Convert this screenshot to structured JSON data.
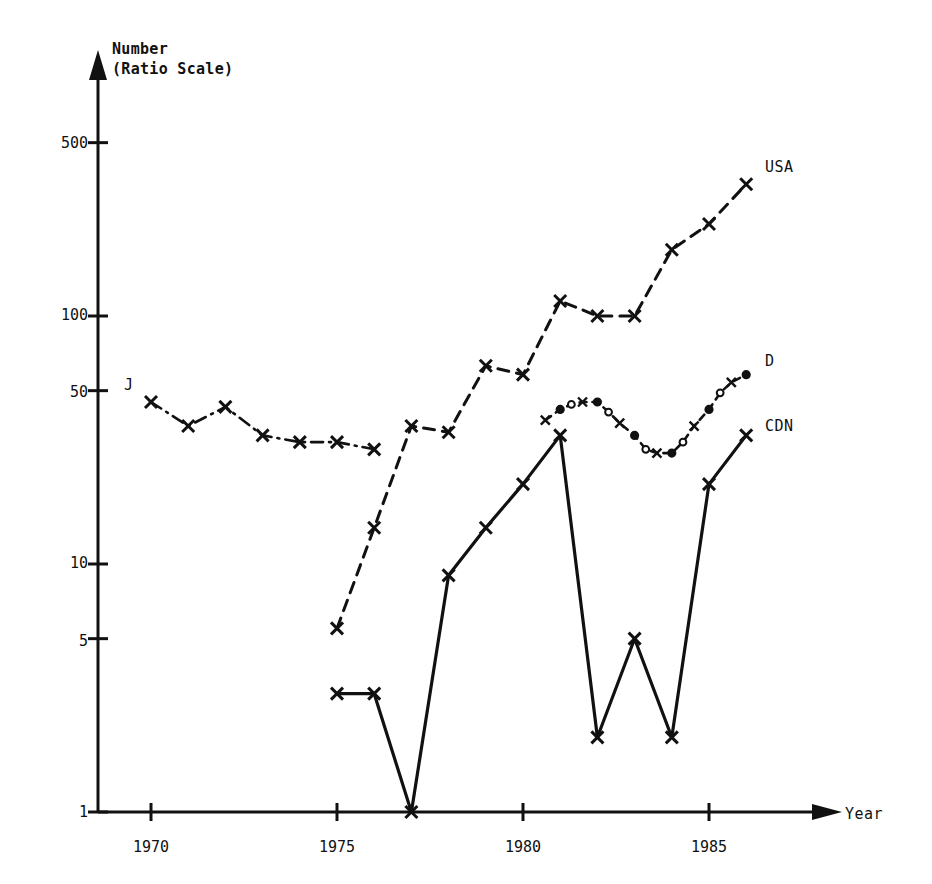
{
  "chart_data": {
    "type": "line",
    "title": "",
    "subtitle": "",
    "ylabel_line1": "Number",
    "ylabel_line2": "(Ratio Scale)",
    "xlabel": "Year",
    "scale": "log",
    "grid": false,
    "legend_position": "inline-right",
    "x_ticks": [
      "1970",
      "1975",
      "1980",
      "1985"
    ],
    "x_tick_values": [
      1970,
      1975,
      1980,
      1985
    ],
    "y_ticks": [
      "1",
      "5",
      "10",
      "50",
      "100",
      "500"
    ],
    "y_tick_values": [
      1,
      5,
      10,
      50,
      100,
      500
    ],
    "xlim": [
      1968.2,
      1987.6
    ],
    "ylim": [
      1,
      900
    ],
    "series": [
      {
        "name": "J",
        "label": "J",
        "line_style": "dash-dot",
        "marker": "x",
        "x": [
          1970,
          1971,
          1972,
          1973,
          1974,
          1975,
          1976
        ],
        "values": [
          45,
          36,
          43,
          33,
          31,
          31,
          29
        ]
      },
      {
        "name": "USA",
        "label": "USA",
        "line_style": "dashed",
        "marker": "x",
        "x": [
          1975,
          1976,
          1977,
          1978,
          1979,
          1980,
          1981,
          1982,
          1983,
          1984,
          1985,
          1986
        ],
        "values": [
          5.5,
          14,
          36,
          34,
          63,
          58,
          115,
          100,
          100,
          185,
          235,
          340
        ]
      },
      {
        "name": "CDN",
        "label": "CDN",
        "line_style": "solid",
        "marker": "x",
        "x": [
          1975,
          1976,
          1977,
          1978,
          1979,
          1980,
          1981,
          1982,
          1983,
          1984,
          1985,
          1986
        ],
        "values": [
          3,
          3,
          1,
          9,
          14,
          21,
          33,
          2,
          5,
          2,
          21,
          33
        ]
      },
      {
        "name": "D",
        "label": "D",
        "line_style": "dotted-dash",
        "marker": "x-circle",
        "x": [
          1980.6,
          1981,
          1981.3,
          1981.6,
          1982,
          1982.3,
          1982.6,
          1983,
          1983.3,
          1983.6,
          1984,
          1984.3,
          1984.6,
          1985,
          1985.3,
          1985.6,
          1986
        ],
        "values": [
          38,
          42,
          44,
          45,
          45,
          41,
          37,
          33,
          29,
          28,
          28,
          31,
          36,
          42,
          49,
          54,
          58
        ]
      }
    ]
  },
  "labels": {
    "j": "J",
    "usa": "USA",
    "cdn": "CDN",
    "d": "D",
    "year": "Year",
    "number": "Number",
    "ratio_scale": "(Ratio Scale)"
  },
  "y_axis_labels": {
    "t500": "500",
    "t100": "100",
    "t50": "50",
    "t10": "10",
    "t5": "5",
    "t1": "1"
  },
  "x_axis_labels": {
    "t1970": "1970",
    "t1975": "1975",
    "t1980": "1980",
    "t1985": "1985"
  },
  "colors": {
    "ink": "#111111",
    "background": "#ffffff"
  }
}
